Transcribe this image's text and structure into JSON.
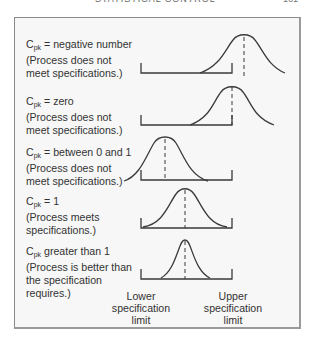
{
  "header": {
    "cut_text": "STATISTICAL CONTROL",
    "page_number": "161"
  },
  "diagram": {
    "rows": [
      {
        "symbol": "C",
        "subscript": "pk",
        "relation": " = negative number",
        "line2": "(Process does not",
        "line3": "meet specifications.)",
        "line4": ""
      },
      {
        "symbol": "C",
        "subscript": "pk",
        "relation": " = zero",
        "line2": "(Process does not",
        "line3": "meet specifications.)",
        "line4": ""
      },
      {
        "symbol": "C",
        "subscript": "pk",
        "relation": " = between 0 and 1",
        "line2": "(Process does not",
        "line3": "meet specifications.)",
        "line4": ""
      },
      {
        "symbol": "C",
        "subscript": "pk",
        "relation": " = 1",
        "line2": "(Process meets",
        "line3": "specifications.)",
        "line4": ""
      },
      {
        "symbol": "C",
        "subscript": "pk",
        "relation": " greater than 1",
        "line2": "(Process is better than",
        "line3": "the specification",
        "line4": "requires.)"
      }
    ],
    "axis_labels": {
      "lower": [
        "Lower",
        "specification",
        "limit"
      ],
      "upper": [
        "Upper",
        "specification",
        "limit"
      ]
    },
    "colors": {
      "line": "#3a3a3a",
      "frame": "#8a8a8a",
      "background": "#f7f7f7"
    }
  }
}
